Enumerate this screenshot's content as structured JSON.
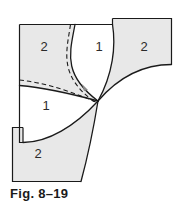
{
  "figure": {
    "caption": "Fig. 8–19",
    "colors": {
      "shaded_fill": "#e8e8e8",
      "white_fill": "#ffffff",
      "stroke": "#1a1a1a",
      "label_text": "#2b2b2b",
      "caption_text": "#1a1a1a",
      "background": "#ffffff"
    },
    "regions": [
      {
        "id": "top-left",
        "label": "2",
        "shading": "shaded",
        "cx": 44,
        "cy": 48
      },
      {
        "id": "top-middle",
        "label": "1",
        "shading": "white",
        "cx": 99,
        "cy": 48
      },
      {
        "id": "top-right",
        "label": "2",
        "shading": "shaded",
        "cx": 144,
        "cy": 48
      },
      {
        "id": "center-left",
        "label": "1",
        "shading": "white",
        "cx": 46,
        "cy": 107
      },
      {
        "id": "bottom-left",
        "label": "2",
        "shading": "shaded",
        "cx": 38,
        "cy": 155
      }
    ],
    "curves": {
      "solid_count": 4,
      "dashed_count": 2,
      "description": "curved cutting lines meeting at a common point"
    }
  }
}
